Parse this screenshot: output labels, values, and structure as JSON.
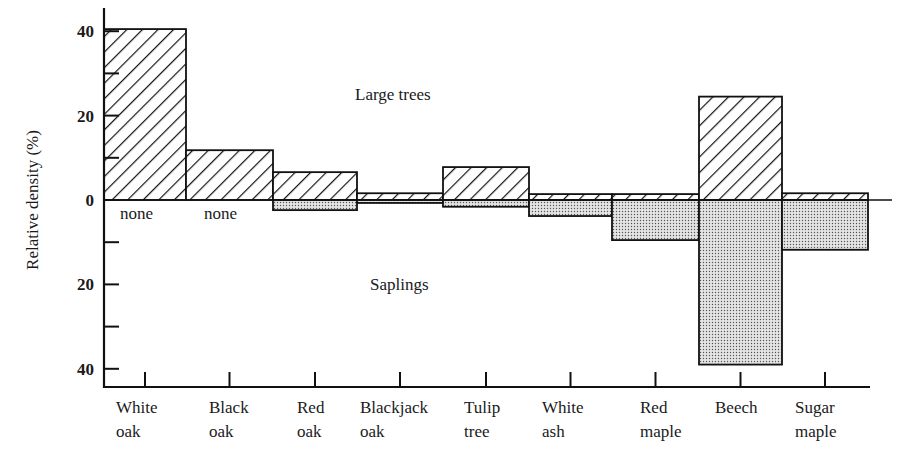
{
  "chart_data": {
    "type": "bar",
    "title": "",
    "xlabel": "",
    "ylabel": "Relative density (%)",
    "ylim": [
      -45,
      45
    ],
    "y_ticks_labeled": [
      40,
      20,
      0,
      20,
      40
    ],
    "y_tick_values": [
      40,
      30,
      20,
      10,
      0,
      -10,
      -20,
      -30,
      -40
    ],
    "categories": [
      [
        "White",
        "oak"
      ],
      [
        "Black",
        "oak"
      ],
      [
        "Red",
        "oak"
      ],
      [
        "Blackjack",
        "oak"
      ],
      [
        "Tulip",
        "tree"
      ],
      [
        "White",
        "ash"
      ],
      [
        "Red",
        "maple"
      ],
      [
        "Beech",
        ""
      ],
      [
        "Sugar",
        "maple"
      ]
    ],
    "series": [
      {
        "name": "Large trees",
        "direction": "up",
        "pattern": "diagonal-hatch",
        "values": [
          40.5,
          11.8,
          6.6,
          1.6,
          7.8,
          1.4,
          1.4,
          24.5,
          1.6
        ]
      },
      {
        "name": "Saplings",
        "direction": "down",
        "pattern": "stipple",
        "values": [
          0,
          0,
          2.4,
          0.7,
          1.6,
          3.8,
          9.5,
          39,
          11.8
        ]
      }
    ],
    "annotations": [
      {
        "text": "Large trees",
        "region": "above-zero"
      },
      {
        "text": "Saplings",
        "region": "below-zero"
      },
      {
        "text": "none",
        "category": "White oak"
      },
      {
        "text": "none",
        "category": "Black oak"
      }
    ],
    "grid": false,
    "legend": "none (inline annotations)"
  },
  "labels": {
    "large_trees": "Large trees",
    "saplings": "Saplings",
    "none": "none",
    "ylabel": "Relative density (%)"
  }
}
